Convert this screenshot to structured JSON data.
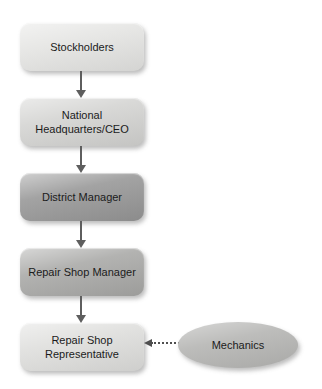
{
  "diagram": {
    "type": "org-chart-flow",
    "nodes": [
      {
        "id": "stockholders",
        "label": "Stockholders",
        "shape": "rounded-rect",
        "fill": "#e4e4e2"
      },
      {
        "id": "national-headquarters-ceo",
        "label": "National Headquarters/CEO",
        "shape": "rounded-rect",
        "fill": "#d3d3d1"
      },
      {
        "id": "district-manager",
        "label": "District Manager",
        "shape": "rounded-rect",
        "fill": "#969696"
      },
      {
        "id": "repair-shop-manager",
        "label": "Repair Shop Manager",
        "shape": "rounded-rect",
        "fill": "#a8a8a6"
      },
      {
        "id": "repair-shop-representative",
        "label": "Repair Shop Representative",
        "shape": "rounded-rect",
        "fill": "#dededc"
      },
      {
        "id": "mechanics",
        "label": "Mechanics",
        "shape": "ellipse",
        "fill": "#b7b7b5"
      }
    ],
    "edges": [
      {
        "from": "stockholders",
        "to": "national-headquarters-ceo",
        "style": "solid-arrow-down"
      },
      {
        "from": "national-headquarters-ceo",
        "to": "district-manager",
        "style": "solid-arrow-down"
      },
      {
        "from": "district-manager",
        "to": "repair-shop-manager",
        "style": "solid-arrow-down"
      },
      {
        "from": "repair-shop-manager",
        "to": "repair-shop-representative",
        "style": "solid-arrow-down"
      },
      {
        "from": "mechanics",
        "to": "repair-shop-representative",
        "style": "dashed-arrow-left"
      }
    ],
    "colors": {
      "background": "#ffffff",
      "arrow": "#5e5e5e",
      "text": "#1b1b1b"
    }
  }
}
